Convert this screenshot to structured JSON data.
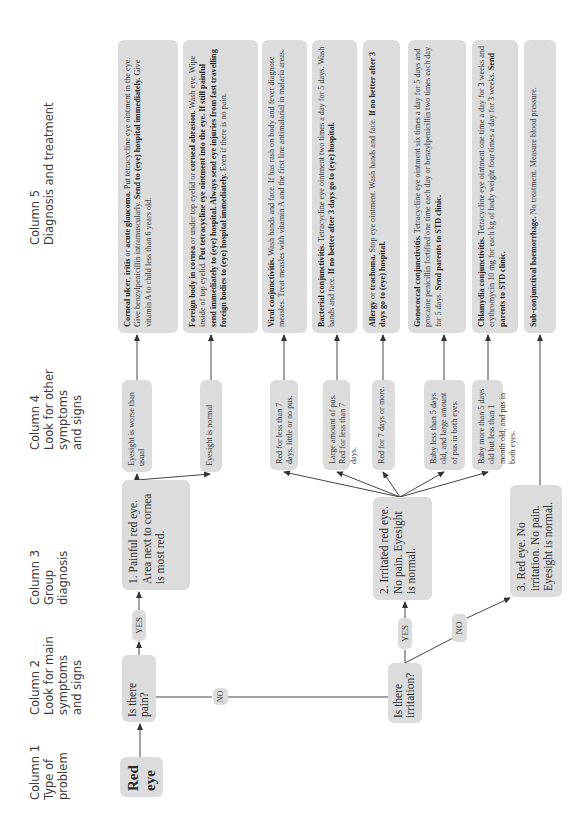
{
  "headers": [
    {
      "title": "Column 1",
      "lines": [
        "Type of",
        "problem"
      ]
    },
    {
      "title": "Column 2",
      "lines": [
        "Look for main",
        "symptoms",
        "and signs"
      ]
    },
    {
      "title": "Column 3",
      "lines": [
        "Group",
        "diagnosis"
      ]
    },
    {
      "title": "Column 4",
      "lines": [
        "Look for other",
        "symptoms",
        "and signs"
      ]
    },
    {
      "title": "Column 5",
      "lines": [
        "Diagnosis and treatment"
      ]
    }
  ],
  "problem": {
    "line1": "Red",
    "line2": "eye"
  },
  "questions": {
    "pain": "Is there pain?",
    "irritation": "Is there irritation?"
  },
  "labels": {
    "yes": "YES",
    "no": "NO"
  },
  "groups": [
    "1. Painful red eye. Area next to cornea is most red.",
    "2. Irritated red eye. No pain. Eyesight is normal.",
    "3. Red eye. No irritation. No pain. Eyesight is normal."
  ],
  "signs": [
    "Eyesight is worse than usual",
    "Eyesight is normal",
    "Red for less than 7 days, little or no pus.",
    "Large amount of pus. Red for less than 7 days.",
    "Red for 7 days or more.",
    "Baby less than 5 days old, and large amount of pus in both eyes.",
    "Baby more than 5 days old but less than 1 month old, and pus in both eyes."
  ],
  "treatments": [
    {
      "segments": [
        {
          "b": true,
          "t": "Corneal ulcer"
        },
        {
          "b": false,
          "t": ", "
        },
        {
          "b": true,
          "t": "iritis"
        },
        {
          "b": false,
          "t": " or "
        },
        {
          "b": true,
          "t": "acute glaucoma."
        },
        {
          "b": false,
          "t": " Put tetracycline eye ointment in the eye. Give benzylpenicillin intramuscularly. "
        },
        {
          "b": true,
          "t": "Send to (eye) hospital immediately."
        },
        {
          "b": false,
          "t": " Give vitamin A to child less than 6 years old."
        }
      ]
    },
    {
      "segments": [
        {
          "b": true,
          "t": "Foreign body in cornea"
        },
        {
          "b": false,
          "t": " or under top eyelid or "
        },
        {
          "b": true,
          "t": "corneal abrasion."
        },
        {
          "b": false,
          "t": " Wash eye. Wipe inside of top eyelid. "
        },
        {
          "b": true,
          "t": "Put tetracycline eye ointment into the eye. If still painful send immediately to (eye) hospital. Always send eye injuries from fast travelling foreign bodies to (eye) hospital immediately."
        },
        {
          "b": false,
          "t": " Even if there is no pain."
        }
      ]
    },
    {
      "segments": [
        {
          "b": true,
          "t": "Viral conjunctivitis."
        },
        {
          "b": false,
          "t": " Wash hands and face. If has rash on body and fever diagnose measles. Treat measles with vitamin A and the first line antimalarial in malaria areas."
        }
      ]
    },
    {
      "segments": [
        {
          "b": true,
          "t": "Bacterial conjunctivitis."
        },
        {
          "b": false,
          "t": " Tetracycline eye ointment two times a day for 5 days. Wash hands and face. "
        },
        {
          "b": true,
          "t": "If no better after 3 days go to (eye) hospital."
        }
      ]
    },
    {
      "segments": [
        {
          "b": true,
          "t": "Allergy"
        },
        {
          "b": false,
          "t": " or "
        },
        {
          "b": true,
          "t": "trachoma."
        },
        {
          "b": false,
          "t": " Stop eye ointment. Wash hands and face. "
        },
        {
          "b": true,
          "t": "If no better after 3 days go to (eye) hospital."
        }
      ]
    },
    {
      "segments": [
        {
          "b": true,
          "t": "Gonococcal conjunctivitis."
        },
        {
          "b": false,
          "t": " Tetracycline eye ointment six times a day for 5 days and procaine penicillin fortified one time each day or benzylpenicillin two times each day for 5 days. "
        },
        {
          "b": true,
          "t": "Send parents to STD clinic."
        }
      ]
    },
    {
      "segments": [
        {
          "b": true,
          "t": "Chlamydia conjunctivitis."
        },
        {
          "b": false,
          "t": " Tetracycline eye ointment one time a day for 3 weeks and erythromycin 10 mg for each kg of body weight four times a day for 3 weeks. "
        },
        {
          "b": true,
          "t": "Send parents to STD clinic."
        }
      ]
    },
    {
      "segments": [
        {
          "b": true,
          "t": "Sub-conjunctival haemorrhage."
        },
        {
          "b": false,
          "t": " No treatment. Measure blood pressure."
        }
      ]
    }
  ]
}
